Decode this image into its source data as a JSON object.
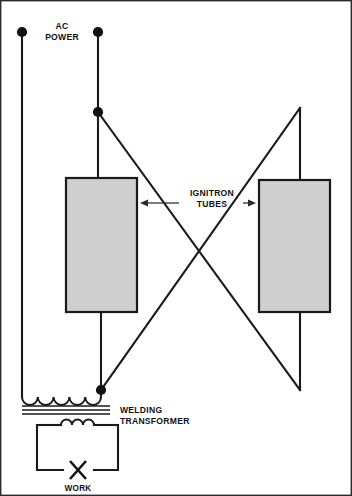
{
  "figure": {
    "background_color": "#ffffff",
    "line_color": "#1a1a1a",
    "box_fill_color": "#cfcfcf",
    "width": 352,
    "height": 496
  },
  "labels": {
    "ac_power_line1": "AC",
    "ac_power_line2": "POWER",
    "ignitron_line1": "IGNITRON",
    "ignitron_line2": "TUBES",
    "welding_line1": "WELDING",
    "welding_line2": "TRANSFORMER",
    "work": "WORK"
  },
  "components": {
    "tube_left": {
      "name": "Ignitron tube (left)",
      "x": 66,
      "y": 178,
      "width": 71,
      "height": 134,
      "fill": "#cfcfcf"
    },
    "tube_right": {
      "name": "Ignitron tube (right)",
      "x": 259,
      "y": 180,
      "width": 71,
      "height": 132,
      "fill": "#cfcfcf"
    },
    "transformer": {
      "name": "Welding transformer",
      "primary_turns": 5,
      "secondary_turns": 3,
      "core_lines": 3
    },
    "work_piece": {
      "name": "Work",
      "symbol": "X"
    }
  },
  "terminals": [
    {
      "name": "ac-terminal-left",
      "x": 22,
      "y": 32,
      "r": 5.1
    },
    {
      "name": "ac-terminal-right",
      "x": 98,
      "y": 32,
      "r": 5.1
    }
  ],
  "junctions": [
    {
      "name": "junction-upper-right-branch",
      "x": 98,
      "y": 112,
      "r": 5.1
    },
    {
      "name": "junction-transformer-primary",
      "x": 101,
      "y": 390,
      "r": 5.1
    }
  ],
  "callouts": [
    {
      "name": "ignitron-tubes-callout",
      "text_x": 212,
      "text_y1": 196,
      "text_y2": 207,
      "left_arrow_from_x": 179,
      "left_arrow_to_x": 140,
      "right_arrow_from_x": 243,
      "right_arrow_to_x": 256,
      "arrow_y": 203
    },
    {
      "name": "welding-transformer-callout",
      "text_x": 120,
      "text_y1": 413,
      "text_y2": 424
    }
  ],
  "wires": {
    "left_supply_path": "M22,32 L22,395",
    "right_supply_path": "M98,32 L98,178",
    "left_tube_bottom_path": "M101,312 L101,392",
    "right_tube_top_path": "M300,108 L300,180",
    "right_tube_bottom_path": "M300,312 L300,390",
    "diagonal_a_path": "M98,112 L300,390",
    "diagonal_b_path": "M300,108 L101,390"
  }
}
